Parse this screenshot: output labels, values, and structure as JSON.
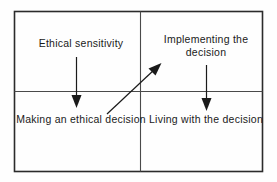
{
  "diagram": {
    "type": "four-quadrant-flow",
    "colors": {
      "background": "#fefefe",
      "border": "#2b2b2b",
      "divider": "#555555",
      "arrow": "#1a1a1a",
      "text": "#1a1a1a"
    },
    "quadrants": [
      {
        "id": "top-left",
        "label": "Ethical sensitivity",
        "lines": [
          "Ethical sensitivity"
        ]
      },
      {
        "id": "top-right",
        "label": "Implementing the decision",
        "lines": [
          "Implementing the",
          "decision"
        ]
      },
      {
        "id": "bottom-left",
        "label": "Making an ethical decision",
        "lines": [
          "Making an",
          "ethical decision"
        ]
      },
      {
        "id": "bottom-right",
        "label": "Living with the decision",
        "lines": [
          "Living with",
          "the decision"
        ]
      }
    ],
    "arrows": [
      {
        "id": "arrow-down-left",
        "direction": "down",
        "from": "Ethical sensitivity",
        "to": "Making an ethical decision"
      },
      {
        "id": "arrow-diagonal",
        "direction": "up-right",
        "from": "Making an ethical decision",
        "to": "Implementing the decision"
      },
      {
        "id": "arrow-down-right",
        "direction": "down",
        "from": "Implementing the decision",
        "to": "Living with the decision"
      }
    ]
  }
}
